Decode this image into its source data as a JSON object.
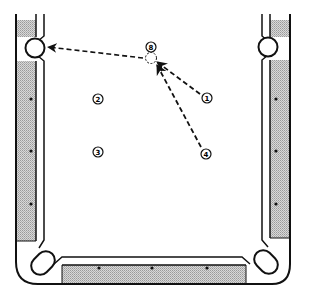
{
  "diagram": {
    "table": {
      "felt_color": "#ffffff",
      "rail_color": "#c8c8c8",
      "line_color": "#111111",
      "diamonds": {
        "left": [
          {
            "x": 31,
            "y": 99
          },
          {
            "x": 31,
            "y": 151
          },
          {
            "x": 31,
            "y": 204
          }
        ],
        "right": [
          {
            "x": 276,
            "y": 99
          },
          {
            "x": 276,
            "y": 151
          },
          {
            "x": 276,
            "y": 204
          }
        ],
        "bottom": [
          {
            "x": 99,
            "y": 268
          },
          {
            "x": 152,
            "y": 268
          },
          {
            "x": 207,
            "y": 268
          }
        ]
      },
      "pockets": [
        {
          "name": "top-left-side",
          "x": 35,
          "y": 48
        },
        {
          "name": "top-right-side",
          "x": 268,
          "y": 47
        },
        {
          "name": "bottom-left-corner",
          "x": 43,
          "y": 263
        },
        {
          "name": "bottom-right-corner",
          "x": 266,
          "y": 262
        }
      ]
    },
    "balls": [
      {
        "label": "8",
        "x": 151,
        "y": 47
      },
      {
        "label": "2",
        "x": 98,
        "y": 99
      },
      {
        "label": "3",
        "x": 98,
        "y": 152
      },
      {
        "label": "1",
        "x": 207,
        "y": 98
      },
      {
        "label": "4",
        "x": 206,
        "y": 154
      }
    ],
    "ghost_ball": {
      "x": 151,
      "y": 58
    },
    "paths": [
      {
        "from": "1",
        "x1": 200,
        "y1": 94,
        "x2": 157,
        "y2": 62
      },
      {
        "from": "4",
        "x1": 201,
        "y1": 147,
        "x2": 157,
        "y2": 64
      },
      {
        "from": "8",
        "x1": 143,
        "y1": 58,
        "x2": 48,
        "y2": 47
      }
    ]
  }
}
